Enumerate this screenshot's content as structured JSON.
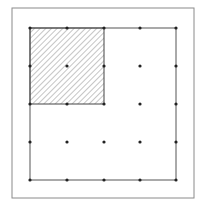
{
  "diagram": {
    "type": "dot-grid-square",
    "outer_frame": {
      "x": 12,
      "y": 8,
      "width": 182,
      "height": 190,
      "stroke": "#8a8a8a"
    },
    "square": {
      "x": 30,
      "y": 28,
      "width": 146,
      "height": 152,
      "stroke": "#555555"
    },
    "grid": {
      "rows": 5,
      "cols": 5,
      "xs": [
        30,
        67,
        104,
        140,
        176
      ],
      "ys": [
        28,
        66,
        104,
        142,
        180
      ],
      "dot_radius": 1.6,
      "dot_color": "#222222"
    },
    "shaded_region": {
      "col_span": [
        0,
        2
      ],
      "row_span": [
        0,
        2
      ],
      "fill": "hatched",
      "hatch_direction": "diagonal-up-right",
      "hatch_color": "#8c8c8c",
      "hatch_spacing": 4,
      "stroke": "#444444"
    },
    "colors": {
      "background": "#ffffff"
    }
  }
}
